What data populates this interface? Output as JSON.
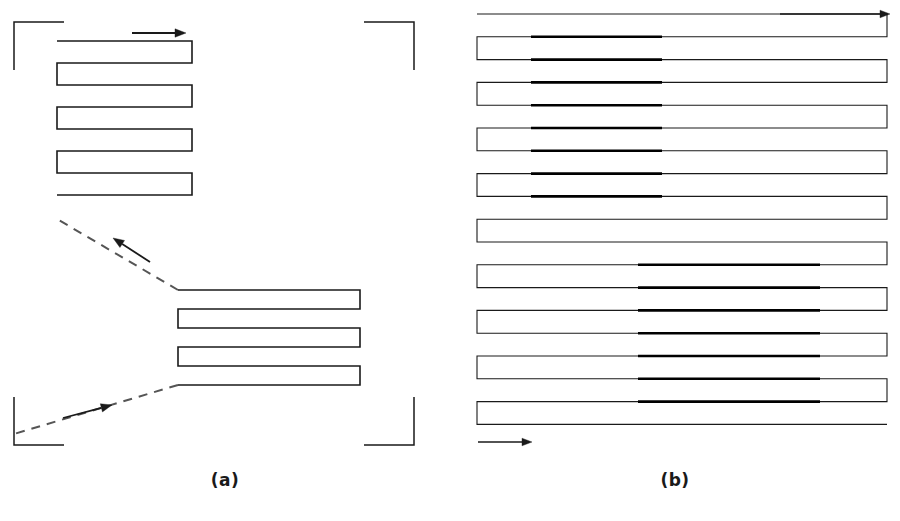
{
  "figure": {
    "background_color": "#ffffff",
    "line_color": "#1a1a1a",
    "bold_line_color": "#000000",
    "dashed_line_color": "#555555",
    "width": 900,
    "height": 521
  },
  "panels": [
    {
      "id": "a",
      "caption": "(a)",
      "description": "Two separate serpentine scan blocks connected by dashed repositioning moves, with field-of-view corner brackets",
      "corner_brackets": [
        {
          "name": "top-left",
          "x": 14,
          "y": 22,
          "arm_h": 50,
          "arm_v": 48
        },
        {
          "name": "top-right",
          "x": 414,
          "y": 22,
          "arm_h": 50,
          "arm_v": 48
        },
        {
          "name": "bottom-left",
          "x": 14,
          "y": 445,
          "arm_h": 50,
          "arm_v": 48
        },
        {
          "name": "bottom-right",
          "x": 414,
          "y": 445,
          "arm_h": 50,
          "arm_v": 48
        }
      ],
      "blocks": [
        {
          "name": "upper-scan-block",
          "x_left": 57,
          "x_right": 192,
          "y_top": 41,
          "pass_count": 8,
          "pass_pitch": 22,
          "stroke_width": 1.6,
          "turn_side_start": "right"
        },
        {
          "name": "lower-scan-block",
          "x_left": 178,
          "x_right": 360,
          "y_top": 290,
          "pass_count": 6,
          "pass_pitch": 19,
          "stroke_width": 1.6,
          "turn_side_start": "right"
        }
      ],
      "arrows": [
        {
          "name": "scan-direction-arrow-top",
          "x1": 132,
          "y1": 33,
          "x2": 186,
          "y2": 33,
          "style": "solid"
        },
        {
          "name": "reposition-arrow-middle",
          "x1": 150,
          "y1": 262,
          "x2": 113,
          "y2": 238,
          "style": "solid"
        },
        {
          "name": "reposition-arrow-bottom",
          "x1": 63,
          "y1": 418,
          "x2": 112,
          "y2": 405,
          "style": "solid"
        }
      ],
      "dashed_paths": [
        {
          "name": "reposition-dash-upper",
          "x1": 178,
          "y1": 290,
          "x2": 57,
          "y2": 219
        },
        {
          "name": "reposition-dash-lower",
          "x1": 178,
          "y1": 385,
          "x2": 14,
          "y2": 434
        }
      ]
    },
    {
      "id": "b",
      "caption": "(b)",
      "description": "Single full-field serpentine scan covering the whole area, with two bold highlighted sub-regions",
      "block": {
        "name": "full-field-scan-block",
        "x_left": 27,
        "x_right": 437,
        "y_top": 14,
        "pass_count": 19,
        "pass_pitch": 22.8,
        "stroke_width": 1.1,
        "turn_side_start": "right"
      },
      "bold_regions": [
        {
          "name": "bold-region-upper-left",
          "x_start": 81,
          "x_end": 212,
          "pass_index_start": 1,
          "pass_index_end": 8,
          "stroke_width": 2.6
        },
        {
          "name": "bold-region-lower-middle",
          "x_start": 188,
          "x_end": 370,
          "pass_index_start": 11,
          "pass_index_end": 17,
          "stroke_width": 2.6
        }
      ],
      "arrows": [
        {
          "name": "scan-direction-arrow-top",
          "x1": 330,
          "y1": 14,
          "x2": 440,
          "y2": 14,
          "style": "solid"
        },
        {
          "name": "scan-direction-arrow-bottom",
          "x1": 28,
          "y1": 442,
          "x2": 82,
          "y2": 442,
          "style": "solid"
        }
      ]
    }
  ]
}
